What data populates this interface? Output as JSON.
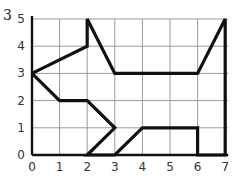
{
  "question_number": "3",
  "chart_data": {
    "type": "line",
    "title": "",
    "xlabel": "",
    "ylabel": "",
    "xlim": [
      0,
      7
    ],
    "ylim": [
      0,
      5
    ],
    "x_ticks": [
      "0",
      "1",
      "2",
      "3",
      "4",
      "5",
      "6",
      "7"
    ],
    "y_ticks": [
      "0",
      "1",
      "2",
      "3",
      "4",
      "5"
    ],
    "grid": true,
    "series": [
      {
        "name": "polygon",
        "closed": true,
        "points": [
          [
            0,
            3
          ],
          [
            2,
            4
          ],
          [
            2,
            5
          ],
          [
            3,
            3
          ],
          [
            6,
            3
          ],
          [
            7,
            5
          ],
          [
            7,
            0
          ],
          [
            6,
            0
          ],
          [
            6,
            1
          ],
          [
            4,
            1
          ],
          [
            3,
            0
          ],
          [
            2,
            0
          ],
          [
            3,
            1
          ],
          [
            2,
            2
          ],
          [
            1,
            2
          ],
          [
            0,
            3
          ]
        ]
      }
    ]
  },
  "colors": {
    "grid": "#9a9a9a",
    "shape": "#111111",
    "axis": "#111111",
    "text": "#333333"
  }
}
